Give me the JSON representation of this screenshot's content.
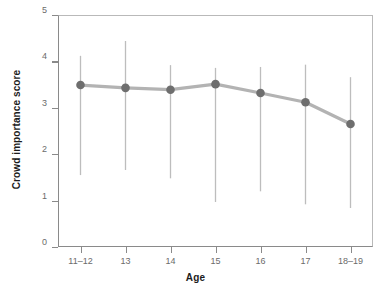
{
  "chart_data": {
    "type": "line",
    "title": "",
    "subtitle": "",
    "xlabel": "Age",
    "ylabel": "Crowd importance score",
    "categories": [
      "11–12",
      "13",
      "14",
      "15",
      "16",
      "17",
      "18–19"
    ],
    "values": [
      3.49,
      3.43,
      3.39,
      3.51,
      3.32,
      3.12,
      2.65
    ],
    "error_bars": {
      "lower": [
        1.55,
        1.66,
        1.48,
        0.97,
        1.2,
        0.92,
        0.84
      ],
      "upper": [
        4.12,
        4.44,
        3.92,
        3.86,
        3.88,
        3.93,
        3.66
      ]
    },
    "ylim": [
      0,
      5
    ],
    "yticks": [
      "0",
      "1",
      "2",
      "3",
      "4",
      "5"
    ],
    "ytick_values": [
      0,
      1,
      2,
      3,
      4,
      5
    ],
    "grid": false,
    "legend": null,
    "series_name": "Crowd importance score",
    "colors": {
      "marker": "#6e6e6e",
      "line": "#b3b3b3",
      "error_bar": "#bdbdbd",
      "axis": "#8a8a8a",
      "tick_label": "#6b6b6b",
      "axis_title": "#1c1c1c",
      "background": "#ffffff"
    },
    "marker_shape": "circle",
    "annotations": []
  }
}
